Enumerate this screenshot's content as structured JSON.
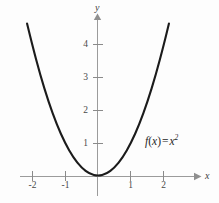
{
  "figure": {
    "background_color": "#fdfdfd",
    "curve_color": "#1b1b1b",
    "axis_color": "#9b9b9b",
    "label_color": "#4a4a4a"
  },
  "axes": {
    "x_name": "x",
    "y_name": "y"
  },
  "labels": {
    "x_ticks": [
      "-2",
      "-1",
      "1",
      "2"
    ],
    "y_ticks": [
      "4",
      "3",
      "2",
      "1"
    ]
  },
  "annotation": {
    "fn": "f",
    "open": "(",
    "arg": "x",
    "close": ")",
    "equals": "=",
    "base": "x",
    "exponent": "2",
    "full_text": "f(x) = x2"
  },
  "chart_data": {
    "type": "line",
    "title": "",
    "subtitle": "",
    "xlabel": "x",
    "ylabel": "y",
    "xlim": [
      -2.6,
      3.1
    ],
    "ylim": [
      -0.8,
      5.2
    ],
    "xticks": [
      -2,
      -1,
      1,
      2
    ],
    "yticks": [
      1,
      2,
      3,
      4
    ],
    "grid": false,
    "legend": false,
    "annotations": [
      {
        "text": "f(x) = x^2",
        "x": 1.45,
        "y": 1.05
      }
    ],
    "series": [
      {
        "name": "f(x) = x^2",
        "equation": "y = x^2",
        "color": "#1b1b1b",
        "x": [
          -2.15,
          -2.0,
          -1.75,
          -1.5,
          -1.25,
          -1.0,
          -0.75,
          -0.5,
          -0.25,
          0,
          0.25,
          0.5,
          0.75,
          1.0,
          1.25,
          1.5,
          1.75,
          2.0,
          2.15
        ],
        "y": [
          4.62,
          4.0,
          3.06,
          2.25,
          1.56,
          1.0,
          0.56,
          0.25,
          0.06,
          0,
          0.06,
          0.25,
          0.56,
          1.0,
          1.56,
          2.25,
          3.06,
          4.0,
          4.62
        ]
      }
    ]
  }
}
